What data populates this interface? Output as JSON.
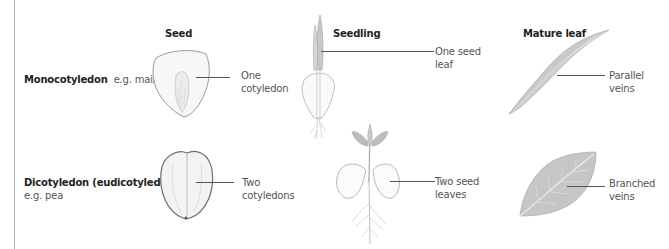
{
  "columns": {
    "seed": "Seed",
    "seedling": "Seedling",
    "mature_leaf": "Mature leaf"
  },
  "rows": [
    {
      "id": "monocot",
      "name": "Monocotyledon",
      "example": "e.g. maize",
      "seed_callout": [
        "One",
        "cotyledon"
      ],
      "seedling_callout": [
        "One seed",
        "leaf"
      ],
      "leaf_callout": [
        "Parallel",
        "veins"
      ]
    },
    {
      "id": "dicot",
      "name": "Dicotyledon (eudicotyledon)",
      "example": "e.g. pea",
      "seed_callout": [
        "Two",
        "cotyledons"
      ],
      "seedling_callout": [
        "Two seed",
        "leaves"
      ],
      "leaf_callout": [
        "Branched",
        "veins"
      ]
    }
  ],
  "colors": {
    "text_dark": "#222222",
    "text_light": "#555555",
    "line": "#555555",
    "illustration_stroke": "#9a9a9a",
    "leaf_fill": "#c9c9c9"
  }
}
